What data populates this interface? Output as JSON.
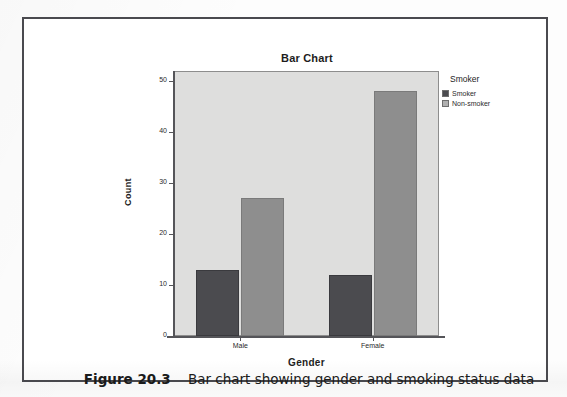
{
  "figure": {
    "caption_number": "Figure 20.3",
    "caption_text": "Bar chart showing gender and smoking status data"
  },
  "chart_data": {
    "type": "bar",
    "title": "Bar Chart",
    "xlabel": "Gender",
    "ylabel": "Count",
    "categories": [
      "Male",
      "Female"
    ],
    "series": [
      {
        "name": "Smoker",
        "values": [
          13,
          12
        ],
        "color": "#4b4b4f"
      },
      {
        "name": "Non-smoker",
        "values": [
          27,
          48
        ],
        "color": "#8e8e8e"
      }
    ],
    "ylim": [
      0,
      52
    ],
    "yticks": [
      0,
      10,
      20,
      30,
      40,
      50
    ],
    "ytick_labels": [
      "0",
      "10",
      "20",
      "30",
      "40",
      "50"
    ],
    "grid": false,
    "legend": {
      "title": "Smoker",
      "position": "right",
      "entries": [
        {
          "label": "Smoker",
          "color": "#4b4b4f"
        },
        {
          "label": "Non-smoker",
          "color": "#b0b0b0"
        }
      ]
    },
    "plot_background": "#dededd",
    "axis_color": "#555559"
  }
}
